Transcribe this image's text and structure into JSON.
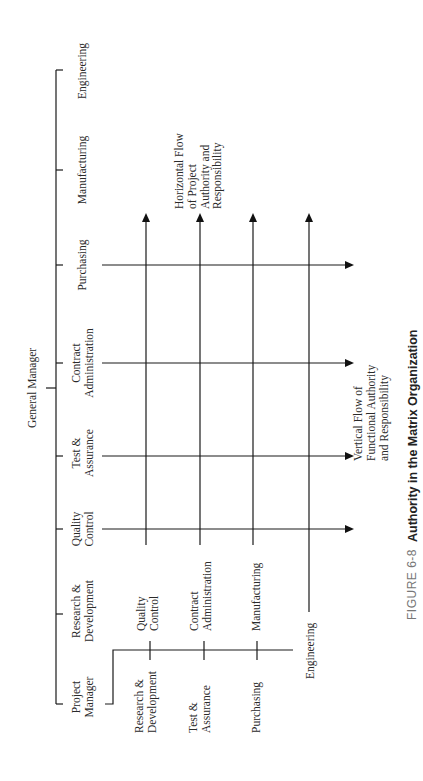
{
  "diagram": {
    "orientation": "rotated-90-counterclockwise",
    "general_manager": "General Manager",
    "functional_units": [
      {
        "id": "engineering",
        "label": [
          "Engineering"
        ]
      },
      {
        "id": "manufacturing",
        "label": [
          "Manufacturing"
        ]
      },
      {
        "id": "purchasing",
        "label": [
          "Purchasing"
        ]
      },
      {
        "id": "contract-administration",
        "label": [
          "Contract",
          "Administration"
        ]
      },
      {
        "id": "test-assurance",
        "label": [
          "Test &",
          "Assurance"
        ]
      },
      {
        "id": "quality-control",
        "label": [
          "Quality",
          "Control"
        ]
      },
      {
        "id": "research-development",
        "label": [
          "Research &",
          "Development"
        ]
      },
      {
        "id": "project-manager",
        "label": [
          "Project",
          "Manager"
        ]
      }
    ],
    "project_manager_branches": {
      "lower": [
        {
          "id": "pm-research-development",
          "label": [
            "Research &",
            "Development"
          ]
        },
        {
          "id": "pm-test-assurance",
          "label": [
            "Test &",
            "Assurance"
          ]
        },
        {
          "id": "pm-purchasing",
          "label": [
            "Purchasing"
          ]
        }
      ],
      "upper": [
        {
          "id": "pm-quality-control",
          "label": [
            "Quality",
            "Control"
          ]
        },
        {
          "id": "pm-contract-administration",
          "label": [
            "Contract",
            "Administration"
          ]
        },
        {
          "id": "pm-manufacturing",
          "label": [
            "Manufacturing"
          ]
        }
      ],
      "end": {
        "id": "pm-engineering",
        "label": [
          "Engineering"
        ]
      }
    },
    "horizontal_flow_note": [
      "Horizontal Flow",
      "of Project",
      "Authority and",
      "Responsibility"
    ],
    "vertical_flow_note": [
      "Vertical Flow of",
      "Functional Authority",
      "and Responsibility"
    ]
  },
  "caption": {
    "figure_number": "FIGURE 6-8",
    "title": "Authority in the Matrix Organization"
  },
  "colors": {
    "line": "#1a1a1a",
    "text": "#2a2a2a",
    "caption_number": "#777777"
  }
}
